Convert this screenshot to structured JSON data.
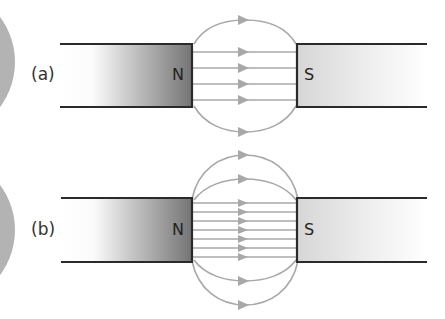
{
  "diagram": {
    "colors": {
      "background": "#ffffff",
      "side_disc": "#b3b3b3",
      "magnet_outline": "#2a2a2a",
      "north_magnet_dark": "#7a7a7a",
      "north_magnet_light": "#ffffff",
      "south_magnet_dark": "#dcdcdc",
      "south_magnet_light": "#ffffff",
      "field_line": "#a8a8a8"
    },
    "panels": [
      {
        "label": "(a)",
        "north_label": "N",
        "south_label": "S",
        "straight_field_lines": 4,
        "curved_field_lines": 2,
        "description": "Fewer, more widely spaced field lines (weaker field)"
      },
      {
        "label": "(b)",
        "north_label": "N",
        "south_label": "S",
        "straight_field_lines": 7,
        "curved_field_lines": 4,
        "description": "More, closely spaced field lines (stronger field)"
      }
    ]
  }
}
